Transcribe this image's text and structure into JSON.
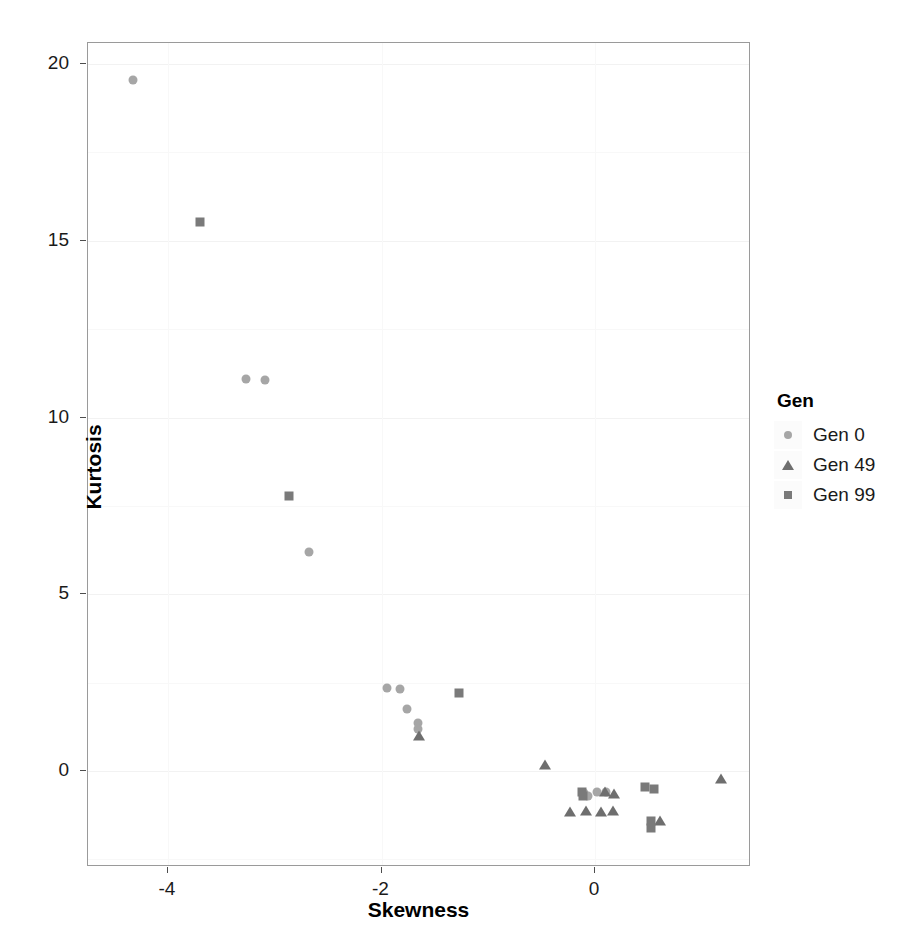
{
  "chart_data": {
    "type": "scatter",
    "title": "",
    "xlabel": "Skewness",
    "ylabel": "Kurtosis",
    "xlim": [
      -4.62,
      -4.62
    ],
    "xlim_actual": [
      -4.62,
      1.45
    ],
    "ylim": [
      -2.2,
      20.9
    ],
    "xticks": [
      -4,
      -2,
      0
    ],
    "xtick_labels": [
      "-4",
      "-2",
      "0"
    ],
    "yticks": [
      0,
      5,
      10,
      15,
      20
    ],
    "ytick_labels": [
      "0",
      "5",
      "10",
      "15",
      "20"
    ],
    "grid": true,
    "legend": {
      "title": "Gen",
      "position": "right",
      "entries": [
        {
          "label": "Gen 0",
          "marker": "circle",
          "color": "#a6a6a6"
        },
        {
          "label": "Gen 49",
          "marker": "triangle",
          "color": "#6e6e6e"
        },
        {
          "label": "Gen 99",
          "marker": "square",
          "color": "#7a7a7a"
        }
      ]
    },
    "series": [
      {
        "name": "Gen 0",
        "marker": "circle",
        "color": "#a6a6a6",
        "points": [
          [
            -4.33,
            19.55
          ],
          [
            -3.27,
            11.1
          ],
          [
            -3.09,
            11.05
          ],
          [
            -2.68,
            6.2
          ],
          [
            -1.95,
            2.35
          ],
          [
            -1.83,
            2.32
          ],
          [
            -1.76,
            1.75
          ],
          [
            -1.66,
            1.35
          ],
          [
            -1.66,
            1.18
          ],
          [
            -0.1,
            -0.62
          ],
          [
            -0.07,
            -0.72
          ],
          [
            0.02,
            -0.6
          ],
          [
            0.1,
            -0.58
          ]
        ]
      },
      {
        "name": "Gen 49",
        "marker": "triangle",
        "color": "#6e6e6e",
        "points": [
          [
            -1.65,
            1.0
          ],
          [
            -0.47,
            0.18
          ],
          [
            -0.23,
            -1.15
          ],
          [
            -0.08,
            -1.12
          ],
          [
            0.06,
            -1.15
          ],
          [
            0.09,
            -0.58
          ],
          [
            0.17,
            -1.13
          ],
          [
            0.18,
            -0.65
          ],
          [
            0.61,
            -1.42
          ],
          [
            1.18,
            -0.23
          ]
        ]
      },
      {
        "name": "Gen 99",
        "marker": "square",
        "color": "#7a7a7a",
        "points": [
          [
            -3.7,
            15.52
          ],
          [
            -2.87,
            7.78
          ],
          [
            -1.27,
            2.22
          ],
          [
            -0.12,
            -0.58
          ],
          [
            -0.11,
            -0.72
          ],
          [
            0.47,
            -0.45
          ],
          [
            0.55,
            -0.52
          ],
          [
            0.52,
            -1.42
          ],
          [
            0.52,
            -1.62
          ]
        ]
      }
    ]
  }
}
